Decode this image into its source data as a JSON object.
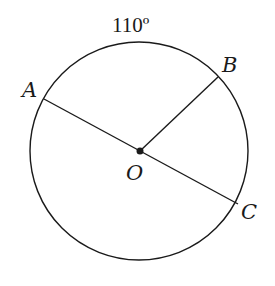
{
  "diagram": {
    "type": "circle-geometry",
    "center_label": "O",
    "points": [
      {
        "label": "A",
        "role": "point on circle, endpoint of diameter AC"
      },
      {
        "label": "B",
        "role": "point on circle, endpoint of radius OB"
      },
      {
        "label": "C",
        "role": "point on circle, endpoint of diameter AC"
      }
    ],
    "segments": [
      "AC (diameter through O)",
      "OB (radius)"
    ],
    "arc_label": "110º",
    "arc": "AB"
  },
  "colors": {
    "stroke": "#1a1a1a",
    "background": "#ffffff"
  }
}
